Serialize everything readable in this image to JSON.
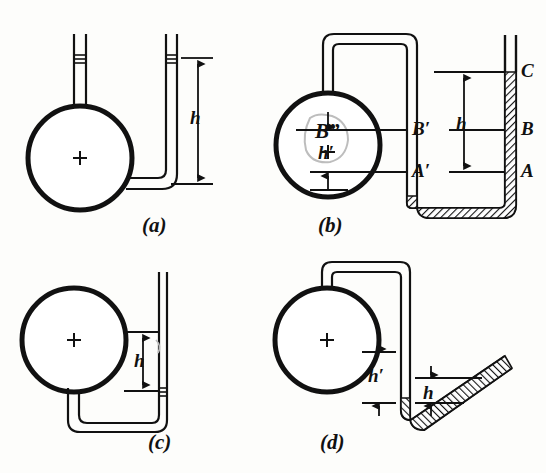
{
  "figure": {
    "background_color": "#fdfdfb",
    "ink_color": "#111111",
    "panels": [
      {
        "id": "a",
        "caption": "(a)",
        "bulb_center_mark": "+",
        "dimension_labels": [
          "h"
        ],
        "level_labels": [],
        "tube_style": "open-ended vertical U, no mercury shading"
      },
      {
        "id": "b",
        "caption": "(b)",
        "bulb_center_mark": "+",
        "bulb_blob_label": "B”",
        "dimension_labels": [
          "h",
          "h′"
        ],
        "level_labels": [
          "C",
          "B",
          "A",
          "B′",
          "A′"
        ],
        "tube_style": "inverted-U into deep U-bend, mercury hatched"
      },
      {
        "id": "c",
        "caption": "(c)",
        "bulb_center_mark": "+",
        "dimension_labels": [
          "h"
        ],
        "level_labels": [],
        "tube_style": "low U-bend with tall open right limb"
      },
      {
        "id": "d",
        "caption": "(d)",
        "bulb_center_mark": "+",
        "dimension_labels": [
          "h",
          "h′"
        ],
        "level_labels": [],
        "tube_style": "inverted-U into short U-bend with inclined open limb, mercury hatched"
      }
    ]
  },
  "labels": {
    "panel_a": "(a)",
    "panel_b": "(b)",
    "panel_c": "(c)",
    "panel_d": "(d)",
    "h": "h",
    "h_prime": "h′",
    "level_a": "A",
    "level_b": "B",
    "level_c": "C",
    "level_a_prime": "A′",
    "level_b_prime": "B′",
    "b_double_prime": "B”",
    "plus": "+"
  }
}
